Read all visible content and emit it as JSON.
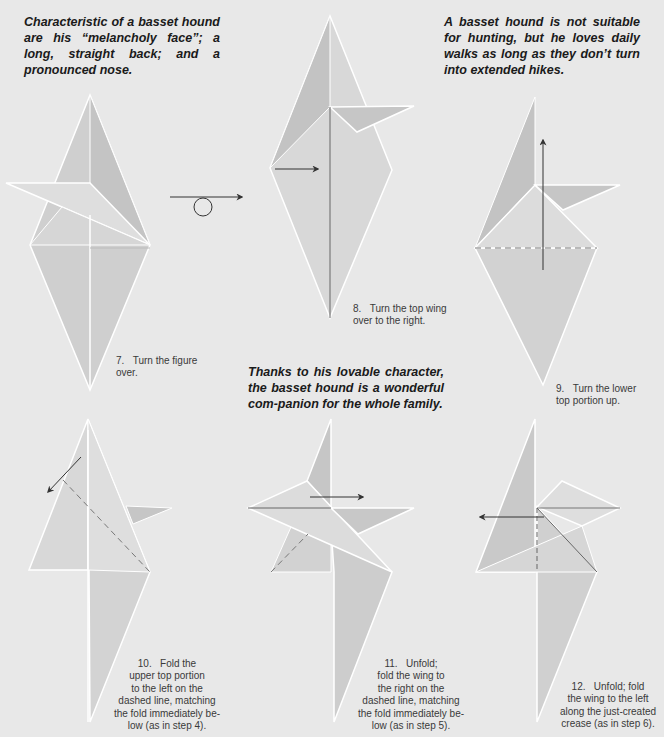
{
  "colors": {
    "background": "#e8e8e8",
    "paper_light": "#dcdcdc",
    "paper_mid": "#cfcfcf",
    "paper_dark": "#bdbdbd",
    "edge": "#ffffff",
    "line": "#555555",
    "text": "#1a1a1a",
    "caption_text": "#3a3a3a"
  },
  "blurbs": {
    "top_left": "Characteristic of a basset hound are his “melancholy face”; a long, straight back; and a pronounced nose.",
    "top_right": "A basset hound is not suitable for hunting, but he loves daily walks as long as they don’t turn into extended hikes.",
    "middle": "Thanks to his lovable character, the basset hound is a wonderful com-panion for the whole family."
  },
  "steps": [
    {
      "number": "7.",
      "text": "Turn the figure\nover.",
      "symbol": "turn-over-arrow"
    },
    {
      "number": "8.",
      "text": "Turn the top wing\nover to the right.",
      "symbol": "arrow-right"
    },
    {
      "number": "9.",
      "text": "Turn the lower\ntop portion up.",
      "symbol": "arrow-up"
    },
    {
      "number": "10.",
      "text": "Fold the\nupper top portion\nto the left on the\ndashed line, matching\nthe fold immediately be-\nlow (as in step 4).",
      "symbol": "arrow-down-left"
    },
    {
      "number": "11.",
      "text": "Unfold;\nfold the wing to\nthe right on the\ndashed line, matching\nthe fold immediately be-\nlow (as in step 5).",
      "symbol": "arrow-right"
    },
    {
      "number": "12.",
      "text": "Unfold; fold\nthe wing to the left\nalong the just-created\ncrease (as in step 6).",
      "symbol": "arrow-left"
    }
  ]
}
